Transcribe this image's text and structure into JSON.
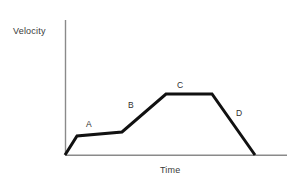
{
  "figure": {
    "type": "velocity-time-graph",
    "background_color": "#ffffff",
    "axis_color": "#8a8a8a",
    "curve_color": "#111111",
    "label_color": "#2e2e2e"
  },
  "axes": {
    "y_title": "Velocity",
    "x_title": "Time",
    "y_axis_top_px": 20,
    "y_axis_bottom_px": 155,
    "x_axis_left_px": 65,
    "x_axis_right_px": 287
  },
  "segment_labels": [
    {
      "text": "A",
      "x": 86,
      "y": 119
    },
    {
      "text": "B",
      "x": 128,
      "y": 100
    },
    {
      "text": "C",
      "x": 177,
      "y": 80
    },
    {
      "text": "D",
      "x": 236,
      "y": 108
    }
  ],
  "chart_data": {
    "type": "line",
    "title": "",
    "subtitle": "",
    "xlabel": "Time",
    "ylabel": "Velocity",
    "xlim": [
      0,
      100
    ],
    "ylim": [
      0,
      100
    ],
    "grid": false,
    "legend": "none",
    "axis_ticks": "none",
    "series": [
      {
        "name": "velocity",
        "x": [
          0,
          5.4,
          25.7,
          45.5,
          66.2,
          85.6
        ],
        "y": [
          0,
          14.1,
          17.0,
          45.2,
          45.2,
          0
        ],
        "points_px": [
          {
            "x": 65,
            "y": 155
          },
          {
            "x": 77,
            "y": 136
          },
          {
            "x": 122,
            "y": 132
          },
          {
            "x": 166,
            "y": 94
          },
          {
            "x": 212,
            "y": 94
          },
          {
            "x": 255,
            "y": 155
          }
        ]
      }
    ],
    "annotations": [
      {
        "label": "A",
        "description": "initial steep rise then gentle upward slope",
        "segment_index": [
          0,
          2
        ]
      },
      {
        "label": "B",
        "description": "steeper constant acceleration",
        "segment_index": [
          2,
          3
        ]
      },
      {
        "label": "C",
        "description": "constant velocity plateau",
        "segment_index": [
          3,
          4
        ]
      },
      {
        "label": "D",
        "description": "deceleration back to zero",
        "segment_index": [
          4,
          5
        ]
      }
    ]
  }
}
